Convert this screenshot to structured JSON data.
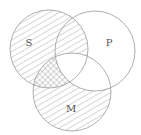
{
  "diagram": {
    "type": "venn",
    "sets": [
      {
        "id": "S",
        "label": "S",
        "cx": 49,
        "cy": 49,
        "r": 39,
        "fill": "hatched"
      },
      {
        "id": "P",
        "label": "P",
        "cx": 95,
        "cy": 51,
        "r": 40,
        "fill": "none"
      },
      {
        "id": "M",
        "label": "M",
        "cx": 72,
        "cy": 92,
        "r": 39,
        "fill": "hatched"
      }
    ],
    "regions": {
      "S_and_M_not_P": "crosshatched",
      "S_only": "hatched",
      "S_and_P_not_M": "hatched",
      "M_only": "hatched",
      "P_and_M_not_S": "unshaded",
      "S_and_P_and_M": "unshaded",
      "P_only": "unshaded"
    },
    "colors": {
      "stroke": "#999999",
      "hatch": "#8a8a8a",
      "label": "#555555"
    }
  }
}
